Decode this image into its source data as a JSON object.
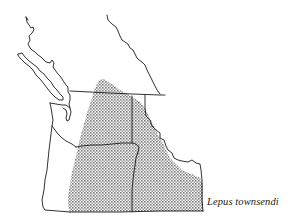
{
  "map": {
    "species_label": "Lepus townsendi",
    "range_fill_color": "#8a8a8a",
    "line_color": "#1a1a1a",
    "background_color": "#ffffff"
  }
}
